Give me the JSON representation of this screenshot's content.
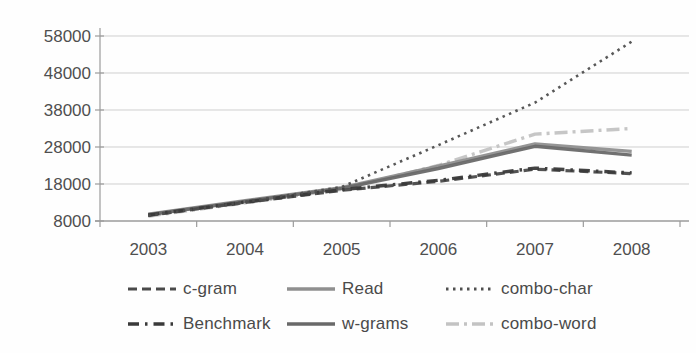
{
  "figure": {
    "background": "#fefefe"
  },
  "chart_data": {
    "type": "line",
    "title": "",
    "xlabel": "",
    "ylabel": "",
    "categories": [
      "2003",
      "2004",
      "2005",
      "2006",
      "2007",
      "2008"
    ],
    "series": [
      {
        "name": "c-gram",
        "style": "dash",
        "color": "#4a4a4a",
        "values": [
          9500,
          13000,
          16300,
          18700,
          22000,
          20800
        ]
      },
      {
        "name": "Read",
        "style": "solid",
        "color": "#8f8f8f",
        "values": [
          9800,
          13500,
          17000,
          22800,
          28800,
          26800
        ]
      },
      {
        "name": "combo-char",
        "style": "dot",
        "color": "#4f4f4f",
        "values": [
          9400,
          13200,
          17200,
          28500,
          40000,
          56500
        ]
      },
      {
        "name": "Benchmark",
        "style": "dash-dot",
        "color": "#3a3a3a",
        "values": [
          9600,
          13100,
          16500,
          19000,
          22300,
          21000
        ]
      },
      {
        "name": "w-grams",
        "style": "solid",
        "color": "#696969",
        "values": [
          9700,
          13300,
          16800,
          22200,
          28200,
          25800
        ]
      },
      {
        "name": "combo-word",
        "style": "long-dash-dot",
        "color": "#c3c3c3",
        "values": [
          9300,
          12900,
          16600,
          23000,
          31500,
          33000
        ]
      }
    ],
    "ylim": [
      8000,
      58000
    ],
    "yticks": [
      8000,
      18000,
      28000,
      38000,
      48000,
      58000
    ],
    "grid": true,
    "legend_position": "bottom",
    "axis_color": "#9b9b9b",
    "grid_color": "#cfcfcf",
    "label_color": "#4f4f4f"
  }
}
